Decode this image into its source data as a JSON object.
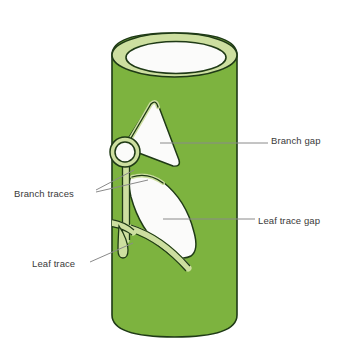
{
  "figure": {
    "kind": "botanical-diagram",
    "background_color": "#ffffff"
  },
  "colors": {
    "stem_green": "#7DB33F",
    "cut_surface_pale_green": "#CDDFA0",
    "gap_white": "#FBFBFA",
    "outline_dark": "#1F3A16",
    "leader_line_gray": "#8A8A8A",
    "label_text": "#3A3A3A"
  },
  "labels": {
    "branch_gap": "Branch gap",
    "leaf_trace_gap": "Leaf trace gap",
    "branch_traces": "Branch traces",
    "leaf_trace": "Leaf trace"
  },
  "parts": [
    {
      "name": "stem-cylinder",
      "description": "Green hollow cylinder of vascular tissue"
    },
    {
      "name": "cut-rim",
      "description": "Pale green elliptical cut surface at top"
    },
    {
      "name": "hollow-core",
      "description": "White interior of the hollow cylinder"
    },
    {
      "name": "branch-gap",
      "description": "White wedge-shaped opening in the vascular cylinder above"
    },
    {
      "name": "leaf-trace-gap",
      "description": "White leaf-shaped opening in the vascular cylinder below"
    },
    {
      "name": "branch-trace-circle",
      "description": "Small circular branch trace cross-section on left edge"
    },
    {
      "name": "branch-trace-strand",
      "description": "Vertical pale green strand running down the cylinder"
    },
    {
      "name": "leaf-trace-strand",
      "description": "Curved pale green strand extending left and ending in a small loop"
    }
  ]
}
